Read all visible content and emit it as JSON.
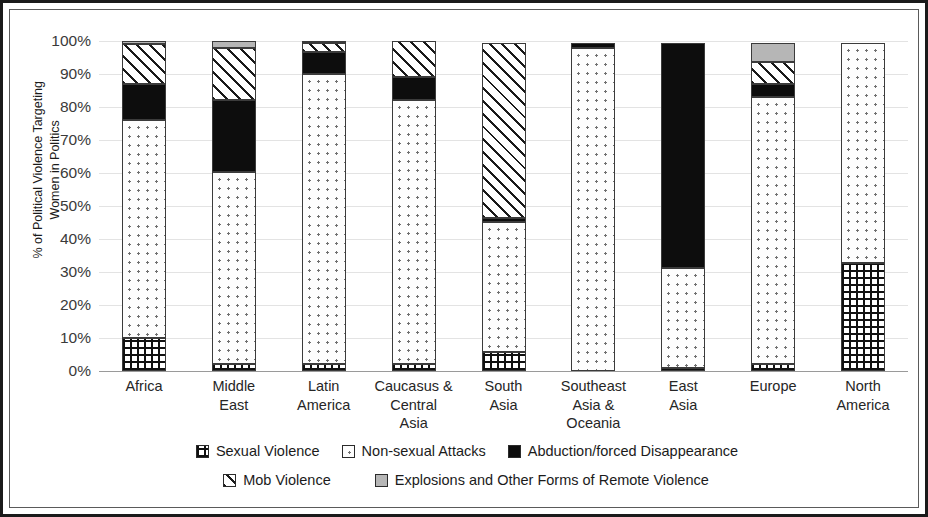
{
  "chart_data": {
    "type": "bar",
    "subtype": "stacked-100-percent",
    "title": "",
    "xlabel": "",
    "ylabel": "% of Political Violence Targeting Women in Politics",
    "ylabel_lines": [
      "% of Political Violence Targeting",
      "Women in Politics"
    ],
    "ylim": [
      0,
      100
    ],
    "ytick_labels": [
      "0%",
      "10%",
      "20%",
      "30%",
      "40%",
      "50%",
      "60%",
      "70%",
      "80%",
      "90%",
      "100%"
    ],
    "ytick_values": [
      0,
      10,
      20,
      30,
      40,
      50,
      60,
      70,
      80,
      90,
      100
    ],
    "grid": true,
    "legend_position": "bottom",
    "categories": [
      "Africa",
      "Middle\nEast",
      "Latin\nAmerica",
      "Caucasus &\nCentral\nAsia",
      "South\nAsia",
      "Southeast\nAsia &\nOceania",
      "East\nAsia",
      "Europe",
      "North\nAmerica"
    ],
    "series": [
      {
        "name": "Sexual Violence",
        "pattern": "checker",
        "color": "#ffffff",
        "values": [
          10.0,
          2.0,
          2.0,
          2.0,
          5.8,
          0.0,
          1.0,
          2.0,
          32.8
        ]
      },
      {
        "name": "Non-sexual Attacks",
        "pattern": "dotted",
        "color": "#fdfdfd",
        "values": [
          66.0,
          58.2,
          88.0,
          80.0,
          39.4,
          98.0,
          30.3,
          81.0,
          66.7
        ]
      },
      {
        "name": "Abduction/forced Disappearance",
        "pattern": "solid-black",
        "color": "#0d0d0d",
        "values": [
          11.0,
          21.8,
          6.7,
          7.0,
          1.3,
          1.5,
          68.2,
          4.0,
          0.0
        ]
      },
      {
        "name": "Mob Violence",
        "pattern": "diagonal-hatch",
        "color": "#ffffff",
        "values": [
          12.0,
          16.0,
          2.6,
          11.0,
          53.0,
          0.0,
          0.0,
          6.5,
          0.0
        ]
      },
      {
        "name": "Explosions and Other Forms of Remote Violence",
        "pattern": "solid-gray",
        "color": "#b6b6b6",
        "values": [
          1.0,
          2.0,
          0.7,
          0.0,
          0.0,
          0.0,
          0.0,
          6.0,
          0.0
        ]
      }
    ]
  }
}
